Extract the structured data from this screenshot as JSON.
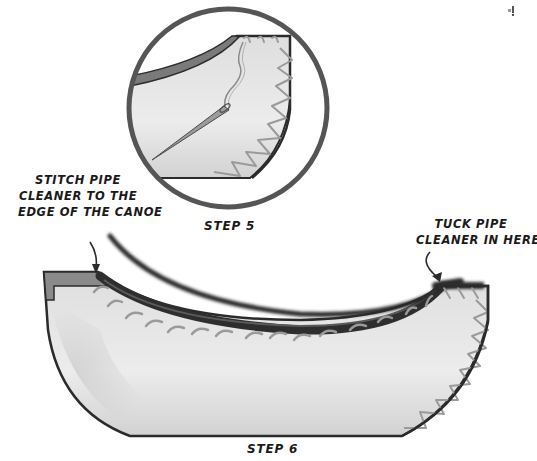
{
  "illustration": {
    "step5": {
      "caption": "STEP 5",
      "description": "Close-up circle of canoe end with needle and thread, zigzag stitching along curved edge"
    },
    "step6": {
      "caption": "STEP 6",
      "description": "Full canoe side with pipe cleaner being stitched along the top rim"
    },
    "annotations": {
      "left_note": {
        "lines": [
          "STITCH PIPE",
          "CLEANER TO THE",
          "EDGE OF THE CANOE"
        ]
      },
      "right_note": {
        "lines": [
          "TUCK PIPE",
          "CLEANER IN HERE"
        ]
      }
    },
    "colors": {
      "outline": "#2b2b2b",
      "canoe_fill": "#e4e4e4",
      "rim_band": "#7a7a7a",
      "stitch": "#9a9a9a",
      "pipe_cleaner": "#2e2e2e",
      "circle_border": "#555555"
    }
  }
}
